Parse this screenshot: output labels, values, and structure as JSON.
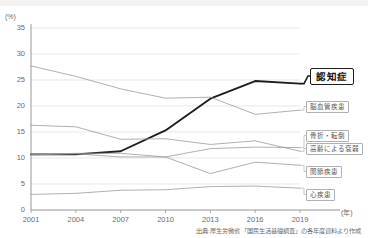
{
  "chart_data": {
    "type": "line",
    "title": "",
    "xlabel": "年",
    "ylabel": "%",
    "x": [
      2001,
      2004,
      2007,
      2010,
      2013,
      2016,
      2019
    ],
    "xlim": [
      2001,
      2019
    ],
    "ylim": [
      0,
      35
    ],
    "ytick_values": [
      0,
      5,
      10,
      15,
      20,
      25,
      30,
      35
    ],
    "ytick_labels": [
      "0",
      "5",
      "10",
      "15",
      "20",
      "25",
      "30",
      "35"
    ],
    "xtick_labels": [
      "2001",
      "2004",
      "2007",
      "2010",
      "2013",
      "2016",
      "2019"
    ],
    "grid": true,
    "legend_position": "right-inline-labels",
    "series": [
      {
        "name": "認知症",
        "label": "認知症",
        "highlight": true,
        "color": "#1d1d1d",
        "width": 1.9,
        "values": [
          10.7,
          10.7,
          11.3,
          15.3,
          21.4,
          24.8,
          24.3
        ]
      },
      {
        "name": "脳血管疾患",
        "label": "脳血管疾患",
        "highlight": false,
        "color": "#9a9a9a",
        "width": 0.8,
        "values": [
          27.7,
          25.7,
          23.3,
          21.5,
          21.7,
          18.4,
          19.2
        ]
      },
      {
        "name": "骨折・転倒",
        "label": "骨折・転倒",
        "highlight": false,
        "color": "#9a9a9a",
        "width": 0.8,
        "values": [
          10.6,
          10.8,
          10.2,
          10.2,
          11.8,
          12.1,
          12.0
        ]
      },
      {
        "name": "高齢による衰弱",
        "label": "高齢による衰弱",
        "highlight": false,
        "color": "#9a9a9a",
        "width": 0.8,
        "values": [
          16.3,
          16.0,
          13.6,
          13.7,
          12.6,
          13.3,
          11.3
        ]
      },
      {
        "name": "関節疾患",
        "label": "関節疾患",
        "highlight": false,
        "color": "#9a9a9a",
        "width": 0.8,
        "values": [
          10.7,
          10.9,
          10.9,
          10.2,
          7.0,
          9.2,
          8.6
        ]
      },
      {
        "name": "心疾患",
        "label": "心疾患",
        "highlight": false,
        "color": "#9a9a9a",
        "width": 0.8,
        "values": [
          3.0,
          3.2,
          3.8,
          3.9,
          4.5,
          4.6,
          4.2
        ]
      }
    ],
    "source": "出典:厚生労働省 「国民生活基礎調査」の各年度資料より作成"
  },
  "axis": {
    "y_unit": "(%)",
    "x_unit": "(年)"
  }
}
